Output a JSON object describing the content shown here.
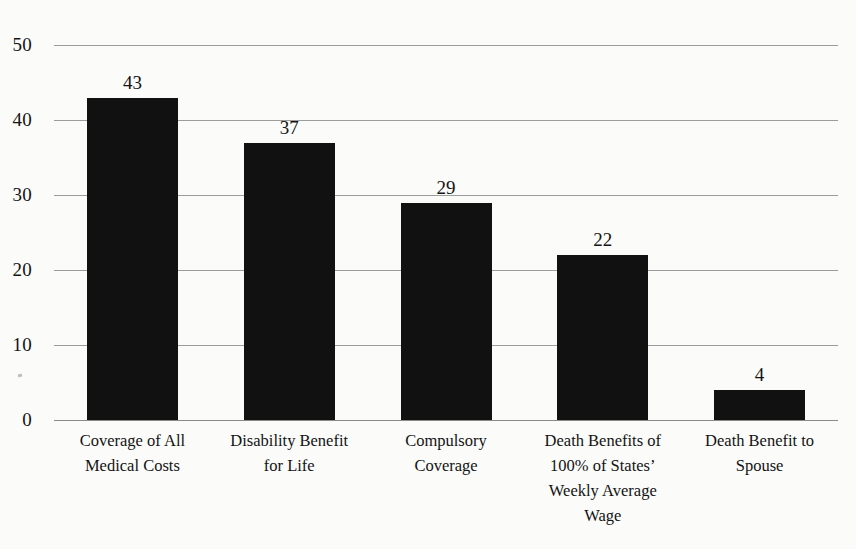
{
  "chart_data": {
    "type": "bar",
    "title": "",
    "subtitle": "",
    "xlabel": "",
    "ylabel": "",
    "ylim": [
      0,
      50
    ],
    "yticks": [
      0,
      10,
      20,
      30,
      40,
      50
    ],
    "ytick_labels": [
      "0",
      "10",
      "20",
      "30",
      "40",
      "50"
    ],
    "grid": true,
    "legend": false,
    "legend_position": "none",
    "bar_color": "#111111",
    "gridline_color": "#9c9c9c",
    "background_color": "#fbfbfa",
    "text_color": "#141414",
    "categories": [
      "Coverage of All Medical Costs",
      "Disability Benefit for Life",
      "Compulsory Coverage",
      "Death Benefits of 100% of States' Weekly Average Wage",
      "Death Benefit to Spouse"
    ],
    "category_lines": [
      [
        "Coverage of All",
        "Medical Costs"
      ],
      [
        "Disability Benefit",
        "for Life"
      ],
      [
        "Compulsory",
        "Coverage"
      ],
      [
        "Death Benefits of",
        "100% of States’",
        "Weekly Average",
        "Wage"
      ],
      [
        "Death Benefit to",
        "Spouse"
      ]
    ],
    "values": [
      43,
      37,
      29,
      22,
      4
    ],
    "value_labels": [
      "43",
      "37",
      "29",
      "22",
      "4"
    ]
  }
}
